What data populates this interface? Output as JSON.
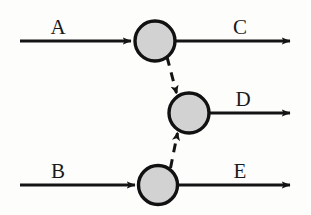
{
  "diagram": {
    "type": "feynman-like-process-diagram",
    "background_color": "#fdfdfc",
    "line_color": "#141414",
    "node_fill_color": "#d2d2d2",
    "node_stroke_color": "#111111",
    "nodes": [
      {
        "id": "top",
        "name": "top-vertex",
        "cx": 155,
        "cy": 41,
        "r": 21
      },
      {
        "id": "middle",
        "name": "middle-vertex",
        "cx": 189,
        "cy": 113,
        "r": 21
      },
      {
        "id": "bottom",
        "name": "bottom-vertex",
        "cx": 158,
        "cy": 185,
        "r": 20
      }
    ],
    "solid_edges": [
      {
        "id": "A",
        "label": "A",
        "direction": "incoming",
        "label_x": 58,
        "label_y": 34,
        "x1": 20,
        "y1": 41,
        "x2": 133,
        "y2": 41
      },
      {
        "id": "C",
        "label": "C",
        "direction": "outgoing",
        "label_x": 240,
        "label_y": 34,
        "x1": 176,
        "y1": 41,
        "x2": 292,
        "y2": 41
      },
      {
        "id": "B",
        "label": "B",
        "direction": "incoming",
        "label_x": 58,
        "label_y": 178,
        "x1": 20,
        "y1": 185,
        "x2": 137,
        "y2": 185
      },
      {
        "id": "E",
        "label": "E",
        "direction": "outgoing",
        "label_x": 240,
        "label_y": 178,
        "x1": 178,
        "y1": 185,
        "x2": 292,
        "y2": 185
      },
      {
        "id": "D",
        "label": "D",
        "direction": "outgoing",
        "label_x": 243,
        "label_y": 106,
        "x1": 210,
        "y1": 113,
        "x2": 292,
        "y2": 113
      }
    ],
    "dashed_edges": [
      {
        "id": "top-to-middle",
        "label": "",
        "from": "top",
        "to": "middle",
        "x1": 168,
        "y1": 59,
        "x2": 177,
        "y2": 94
      },
      {
        "id": "bottom-to-middle",
        "label": "",
        "from": "bottom",
        "to": "middle",
        "x1": 171,
        "y1": 167,
        "x2": 178,
        "y2": 132
      }
    ]
  }
}
